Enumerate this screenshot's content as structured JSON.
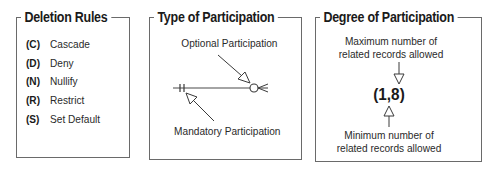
{
  "panels": {
    "deletion_rules": {
      "title": "Deletion Rules",
      "rules": [
        {
          "code": "(C)",
          "label": "Cascade"
        },
        {
          "code": "(D)",
          "label": "Deny"
        },
        {
          "code": "(N)",
          "label": "Nullify"
        },
        {
          "code": "(R)",
          "label": "Restrict"
        },
        {
          "code": "(S)",
          "label": "Set Default"
        }
      ]
    },
    "type_of_participation": {
      "title": "Type of Participation",
      "optional_label": "Optional Participation",
      "mandatory_label": "Mandatory Participation",
      "symbols": {
        "left_end": "two-tick-mandatory-one",
        "right_end": "circle-crowsfoot-optional-many"
      }
    },
    "degree_of_participation": {
      "title": "Degree of Participation",
      "max_label_line1": "Maximum number of",
      "max_label_line2": "related records allowed",
      "degree_value": "(1,8)",
      "min_label_line1": "Minimum number of",
      "min_label_line2": "related records allowed"
    }
  },
  "colors": {
    "line": "#4a4a4a",
    "border": "#6a6a6a",
    "text": "#1a1a1a",
    "background": "#ffffff"
  }
}
